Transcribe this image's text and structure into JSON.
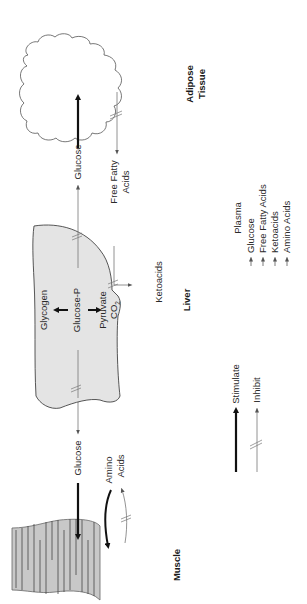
{
  "diagram": {
    "orientation": "rotated-90-ccw",
    "organs": {
      "muscle": "Muscle",
      "liver": "Liver",
      "adipose_line1": "Adipose",
      "adipose_line2": "Tissue"
    },
    "liver_internal": {
      "glycogen": "Glycogen",
      "glucose_p": "Glucose-P",
      "pyruvate": "Pyruvate",
      "co2_main": "CO",
      "co2_sub": "2"
    },
    "flows": {
      "liver_to_muscle_glucose": "Glucose",
      "muscle_amino_line1": "Amino",
      "muscle_amino_line2": "Acids",
      "liver_to_adipose_glucose": "Glucose",
      "adipose_ffa_line1": "Free Fatty",
      "adipose_ffa_line2": "Acids",
      "liver_ketoacids": "Ketoacids"
    },
    "legend": {
      "stimulate": "Stimulate",
      "inhibit": "Inhibit"
    },
    "plasma": {
      "title": "Plasma",
      "items": [
        {
          "label": "Glucose",
          "direction": "up"
        },
        {
          "label": "Free Fatty Acids",
          "direction": "up"
        },
        {
          "label": "Ketoacids",
          "direction": "up"
        },
        {
          "label": "Amino Acids",
          "direction": "up"
        }
      ]
    },
    "colors": {
      "tissue_fill": "#c8c8c8",
      "liver_fill": "#e4e4e4",
      "stimulate_arrow": "#111111",
      "inhibit_arrow": "#777777"
    }
  }
}
